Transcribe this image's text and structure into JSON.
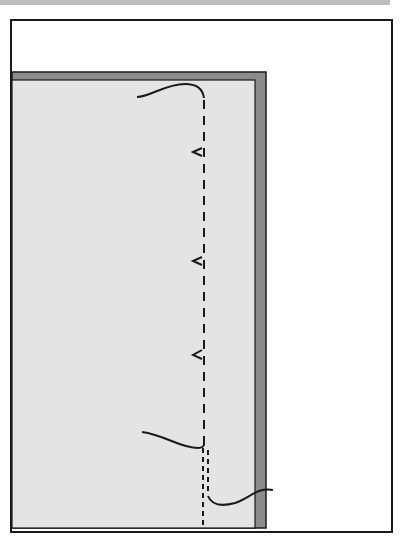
{
  "diagram": {
    "type": "sewing-instruction-illustration",
    "colors": {
      "background": "#ffffff",
      "frame": "#1a1a1a",
      "fabric": "#e4e4e4",
      "fabric_edge": "#8c8c8c",
      "stitch": "#1a1a1a",
      "top_strip": "#bdbdbd"
    },
    "elements": {
      "fabric_panel": "fabric-panel",
      "stitch_line": "basting-stitch-line",
      "thread_tail_top": "thread-tail-top",
      "thread_tail_middle": "thread-tail-lower-left",
      "thread_tail_bottom": "thread-tail-bottom-right",
      "stitch_marks_count": 3
    }
  }
}
